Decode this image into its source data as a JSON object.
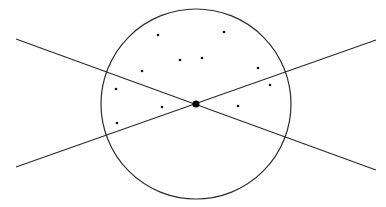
{
  "diagram": {
    "background": "#ffffff",
    "stroke_color": "#2b2b2b",
    "circle": {
      "cx": 196,
      "cy": 104,
      "r": 95
    },
    "center_point": {
      "x": 196,
      "y": 104,
      "r": 3.5
    },
    "lines": [
      {
        "name": "line-descending",
        "x1": 16,
        "y1": 39,
        "x2": 376,
        "y2": 170
      },
      {
        "name": "line-ascending",
        "x1": 16,
        "y1": 167,
        "x2": 376,
        "y2": 40
      }
    ],
    "points": [
      {
        "x": 158,
        "y": 35
      },
      {
        "x": 224,
        "y": 32
      },
      {
        "x": 180,
        "y": 60
      },
      {
        "x": 202,
        "y": 58
      },
      {
        "x": 142,
        "y": 71
      },
      {
        "x": 258,
        "y": 68
      },
      {
        "x": 270,
        "y": 85
      },
      {
        "x": 116,
        "y": 89
      },
      {
        "x": 162,
        "y": 107
      },
      {
        "x": 238,
        "y": 106
      },
      {
        "x": 117,
        "y": 123
      }
    ],
    "point_radius": 1.3
  }
}
